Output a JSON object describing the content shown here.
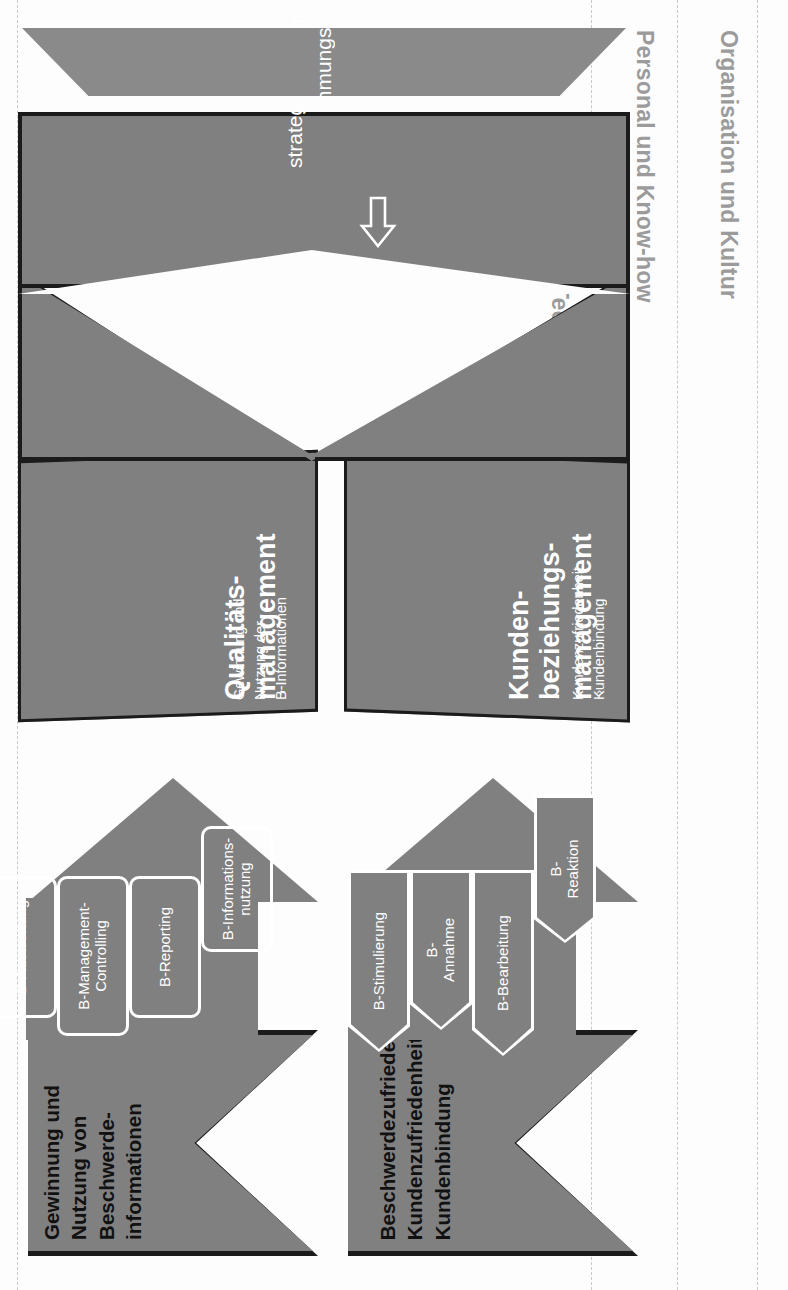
{
  "figure": {
    "colors": {
      "gray_fill": "#808080",
      "ink": "#1b1b1b",
      "label_gray": "#9b9b9b",
      "white": "#ffffff",
      "background": "#fdfdfd"
    }
  },
  "context_bands": [
    {
      "label": "Organisation und Kultur"
    },
    {
      "label": "Personal und Know-how"
    },
    {
      "label": "Technologie"
    }
  ],
  "outcome_panels": [
    {
      "id": "panel-kundenbindung",
      "text": "Beschwerdezufriedenheit\nKundenzufriedenheit\nKundenbindung"
    },
    {
      "id": "panel-beschwerdeinformationen",
      "text": "Gewinnung und\nNutzung von\nBeschwerde-\ninformationen"
    }
  ],
  "direct_process": {
    "name": "Direkter Beschwerdemanagementprozess",
    "steps": [
      {
        "label": "B-Stimulierung"
      },
      {
        "label": "B-\nAnnahme"
      },
      {
        "label": "B-Bearbeitung"
      },
      {
        "label": "B-\nReaktion"
      }
    ]
  },
  "indirect_process": {
    "name": "Indirekter Beschwerdemanagementprozess",
    "steps": [
      {
        "label": "B-Auswertung"
      },
      {
        "label": "B-Management-\nControlling"
      },
      {
        "label": "B-Reporting"
      },
      {
        "label": "B-Informations-\nnutzung"
      }
    ]
  },
  "management_panels": [
    {
      "id": "kundenbeziehungsmanagement",
      "title": "Kunden-\nbeziehungs-\nmanagement",
      "bullets": "Kundenzufriedenheit\nKundenbindung",
      "bullet_glyph": "›"
    },
    {
      "id": "qualitaetsmanagement",
      "title": "Qualitäts-\nmanagement",
      "bullets": "Gewinnung und\nNutzung der\nB-Informationen",
      "bullet_glyph": "›"
    }
  ],
  "foundation": {
    "goals_label": "Ziele und Grundsätze",
    "planning_label": "strategische Planung",
    "strategy_label": "Unternehmungsstrategie"
  }
}
